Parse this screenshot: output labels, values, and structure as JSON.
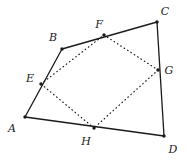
{
  "figure": {
    "type": "geometry-diagram",
    "width": 187,
    "height": 163,
    "background_color": "#ffffff",
    "stroke_color": "#1a1a1a",
    "solid_stroke_width": 1.3,
    "dotted_stroke_width": 1.2,
    "dot_radius": 1.7,
    "outer_polygon": {
      "name": "ABCD",
      "style": "solid",
      "closed": true,
      "vertices": [
        "A",
        "B",
        "C",
        "D"
      ]
    },
    "inner_polygon": {
      "name": "EFGH",
      "style": "dotted",
      "closed": true,
      "vertices": [
        "E",
        "F",
        "G",
        "H"
      ]
    },
    "points": [
      {
        "id": "A",
        "label": "A",
        "x": 25,
        "y": 117,
        "label_x": 12,
        "label_y": 128,
        "marked": true,
        "kind": "outer-vertex"
      },
      {
        "id": "B",
        "label": "B",
        "x": 62,
        "y": 49,
        "label_x": 53,
        "label_y": 37,
        "marked": true,
        "kind": "outer-vertex"
      },
      {
        "id": "C",
        "label": "C",
        "x": 157,
        "y": 22,
        "label_x": 165,
        "label_y": 11,
        "marked": true,
        "kind": "outer-vertex"
      },
      {
        "id": "D",
        "label": "D",
        "x": 164,
        "y": 136,
        "label_x": 173,
        "label_y": 149,
        "marked": true,
        "kind": "outer-vertex"
      },
      {
        "id": "E",
        "label": "E",
        "x": 41,
        "y": 84,
        "label_x": 30,
        "label_y": 78,
        "marked": true,
        "kind": "midpoint"
      },
      {
        "id": "F",
        "label": "F",
        "x": 104,
        "y": 35,
        "label_x": 99,
        "label_y": 24,
        "marked": true,
        "kind": "midpoint"
      },
      {
        "id": "G",
        "label": "G",
        "x": 158,
        "y": 70,
        "label_x": 169,
        "label_y": 70,
        "marked": true,
        "kind": "midpoint"
      },
      {
        "id": "H",
        "label": "H",
        "x": 94,
        "y": 128,
        "label_x": 86,
        "label_y": 141,
        "marked": true,
        "kind": "midpoint"
      }
    ],
    "solid_edges": [
      {
        "id": "AB",
        "from": "A",
        "to": "B"
      },
      {
        "id": "BC",
        "from": "B",
        "to": "C"
      },
      {
        "id": "CD",
        "from": "C",
        "to": "D"
      },
      {
        "id": "DA",
        "from": "D",
        "to": "A"
      }
    ],
    "dotted_edges": [
      {
        "id": "EF",
        "from": "E",
        "to": "F"
      },
      {
        "id": "FG",
        "from": "F",
        "to": "G"
      },
      {
        "id": "GH",
        "from": "G",
        "to": "H"
      },
      {
        "id": "HE",
        "from": "H",
        "to": "E"
      }
    ]
  }
}
